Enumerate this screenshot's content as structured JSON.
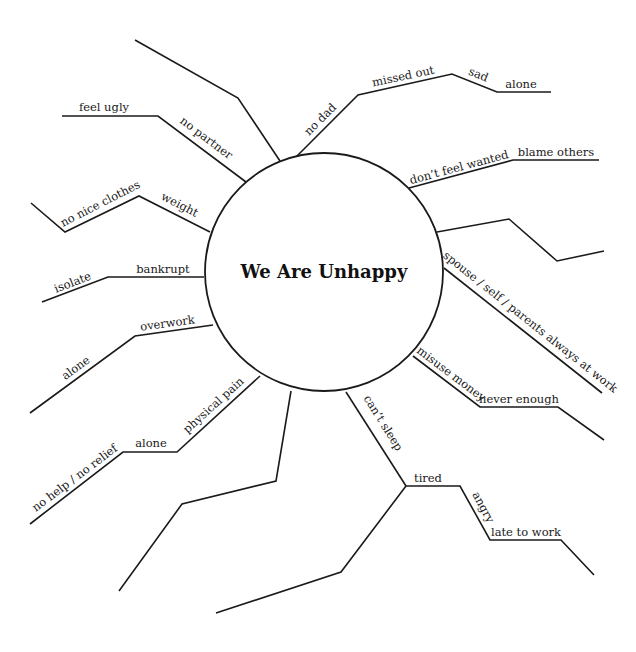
{
  "diagram": {
    "type": "mind-map",
    "center": {
      "label": "We Are Unhappy"
    },
    "branches": [
      {
        "id": "blank-top-left",
        "chain": []
      },
      {
        "id": "no-partner",
        "chain": [
          "no partner",
          "feel ugly"
        ]
      },
      {
        "id": "no-dad",
        "chain": [
          "no dad",
          "missed out",
          "sad",
          "alone"
        ]
      },
      {
        "id": "dont-feel-wanted",
        "chain": [
          "don't feel wanted",
          "blame others"
        ]
      },
      {
        "id": "blank-right",
        "chain": []
      },
      {
        "id": "always-at-work",
        "chain": [
          "spouse / self / parents always at work"
        ]
      },
      {
        "id": "misuse-money",
        "chain": [
          "misuse money",
          "never enough"
        ]
      },
      {
        "id": "cant-sleep",
        "chain": [
          "can't sleep",
          "tired",
          "angry",
          "late to work"
        ]
      },
      {
        "id": "blank-bottom",
        "chain": []
      },
      {
        "id": "physical-pain",
        "chain": [
          "physical pain",
          "alone",
          "no help / no relief"
        ]
      },
      {
        "id": "overwork",
        "chain": [
          "overwork",
          "alone"
        ]
      },
      {
        "id": "bankrupt",
        "chain": [
          "bankrupt",
          "isolate"
        ]
      },
      {
        "id": "weight",
        "chain": [
          "weight",
          "no nice clothes"
        ]
      }
    ]
  },
  "labels": {
    "center": "We Are Unhappy",
    "no_partner": "no partner",
    "feel_ugly": "feel ugly",
    "no_dad": "no dad",
    "missed_out": "missed out",
    "sad": "sad",
    "alone_top": "alone",
    "dont_feel_wanted": "don’t feel wanted",
    "blame_others": "blame others",
    "always_at_work": "spouse / self / parents always at work",
    "misuse_money": "misuse money",
    "never_enough": "never enough",
    "cant_sleep": "can’t sleep",
    "tired": "tired",
    "angry": "angry",
    "late_to_work": "late to work",
    "physical_pain": "physical pain",
    "alone_pain": "alone",
    "no_help": "no help / no relief",
    "overwork": "overwork",
    "alone_overwork": "alone",
    "bankrupt": "bankrupt",
    "isolate": "isolate",
    "weight": "weight",
    "no_nice_clothes": "no nice clothes"
  }
}
